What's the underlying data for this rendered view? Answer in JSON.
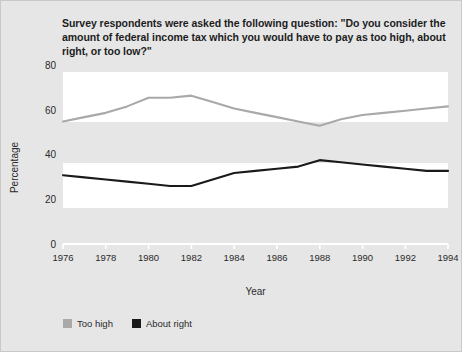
{
  "title": "Survey respondents were asked the following question: \"Do you consider the amount of federal income tax which you would have to pay as too high, about right, or too low?\"",
  "axes": {
    "xlabel": "Year",
    "ylabel": "Percentage"
  },
  "legend": {
    "items": [
      {
        "label": "Too high",
        "color": "#a9a9a9"
      },
      {
        "label": "About right",
        "color": "#1a1a1a"
      }
    ]
  },
  "ticks": {
    "y": [
      "0",
      "20",
      "40",
      "60",
      "80"
    ],
    "x": [
      "1976",
      "1978",
      "1980",
      "1982",
      "1984",
      "1986",
      "1988",
      "1990",
      "1992",
      "1994"
    ]
  },
  "chart_data": {
    "type": "line",
    "title": "Survey respondents were asked the following question: \"Do you consider the amount of federal income tax which you would have to pay as too high, about right, or too low?\"",
    "xlabel": "Year",
    "ylabel": "Percentage",
    "x": [
      1976,
      1977,
      1978,
      1979,
      1980,
      1981,
      1982,
      1983,
      1984,
      1985,
      1986,
      1987,
      1988,
      1989,
      1990,
      1991,
      1992,
      1993,
      1994
    ],
    "xlim": [
      1976,
      1994
    ],
    "ylim": [
      0,
      80
    ],
    "yticks": [
      0,
      20,
      40,
      60,
      80
    ],
    "xticks": [
      1976,
      1978,
      1980,
      1982,
      1984,
      1986,
      1988,
      1990,
      1992,
      1994
    ],
    "grid": "horizontal-banded",
    "legend_position": "bottom-left",
    "series": [
      {
        "name": "Too high",
        "color": "#a9a9a9",
        "values": [
          57,
          59,
          61,
          64,
          68,
          68,
          69,
          66,
          63,
          61,
          59,
          57,
          55,
          58,
          60,
          61,
          62,
          63,
          64
        ]
      },
      {
        "name": "About right",
        "color": "#1a1a1a",
        "values": [
          32,
          31,
          30,
          29,
          28,
          27,
          27,
          30,
          33,
          34,
          35,
          36,
          39,
          38,
          37,
          36,
          35,
          34,
          34
        ]
      }
    ]
  }
}
